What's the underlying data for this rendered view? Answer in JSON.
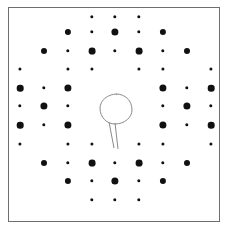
{
  "figure": {
    "kind": "electron-diffraction-pattern",
    "background_color": "#ffffff",
    "frame_border_color": "#6e6e6e",
    "spot_color": "#111111",
    "annotation_color": "#8a8a8a",
    "frame": {
      "x": 8,
      "y": 7,
      "width": 212,
      "height": 215
    }
  },
  "chart_data": {
    "type": "scatter",
    "title": "",
    "subtitle": "",
    "xlabel": "",
    "ylabel": "",
    "grid": false,
    "legend": null,
    "xlim": [
      0,
      212
    ],
    "ylim": [
      0,
      215
    ],
    "lattice": {
      "x_spacing": 23.6,
      "y_spacing": 18.4,
      "center_x": 107,
      "center_y": 108
    },
    "size_legend": {
      "large": "strong reflection",
      "small": "weak reflection"
    },
    "points": [
      {
        "x": 83,
        "y": 9,
        "r": 1.7,
        "intensity": "weak"
      },
      {
        "x": 106,
        "y": 9,
        "r": 1.7,
        "intensity": "weak"
      },
      {
        "x": 130,
        "y": 9,
        "r": 1.7,
        "intensity": "weak"
      },
      {
        "x": 59,
        "y": 24,
        "r": 3.1,
        "intensity": "strong"
      },
      {
        "x": 83,
        "y": 24,
        "r": 1.7,
        "intensity": "weak"
      },
      {
        "x": 106,
        "y": 24,
        "r": 3.6,
        "intensity": "strong"
      },
      {
        "x": 130,
        "y": 24,
        "r": 1.7,
        "intensity": "weak"
      },
      {
        "x": 154,
        "y": 24,
        "r": 3.1,
        "intensity": "strong"
      },
      {
        "x": 35,
        "y": 43,
        "r": 3.0,
        "intensity": "strong"
      },
      {
        "x": 59,
        "y": 43,
        "r": 1.7,
        "intensity": "weak"
      },
      {
        "x": 83,
        "y": 43,
        "r": 3.4,
        "intensity": "strong"
      },
      {
        "x": 106,
        "y": 43,
        "r": 1.7,
        "intensity": "weak"
      },
      {
        "x": 130,
        "y": 43,
        "r": 3.4,
        "intensity": "strong"
      },
      {
        "x": 154,
        "y": 43,
        "r": 1.7,
        "intensity": "weak"
      },
      {
        "x": 178,
        "y": 43,
        "r": 3.0,
        "intensity": "strong"
      },
      {
        "x": 11,
        "y": 61,
        "r": 1.6,
        "intensity": "weak"
      },
      {
        "x": 59,
        "y": 61,
        "r": 1.6,
        "intensity": "weak"
      },
      {
        "x": 83,
        "y": 61,
        "r": 1.6,
        "intensity": "weak"
      },
      {
        "x": 130,
        "y": 61,
        "r": 1.6,
        "intensity": "weak"
      },
      {
        "x": 154,
        "y": 61,
        "r": 1.6,
        "intensity": "weak"
      },
      {
        "x": 202,
        "y": 61,
        "r": 1.6,
        "intensity": "weak"
      },
      {
        "x": 11,
        "y": 80,
        "r": 3.3,
        "intensity": "strong"
      },
      {
        "x": 35,
        "y": 80,
        "r": 1.7,
        "intensity": "weak"
      },
      {
        "x": 59,
        "y": 80,
        "r": 3.6,
        "intensity": "strong"
      },
      {
        "x": 154,
        "y": 80,
        "r": 3.6,
        "intensity": "strong"
      },
      {
        "x": 178,
        "y": 80,
        "r": 1.7,
        "intensity": "weak"
      },
      {
        "x": 202,
        "y": 80,
        "r": 3.3,
        "intensity": "strong"
      },
      {
        "x": 11,
        "y": 98,
        "r": 1.7,
        "intensity": "weak"
      },
      {
        "x": 35,
        "y": 98,
        "r": 3.6,
        "intensity": "strong"
      },
      {
        "x": 59,
        "y": 98,
        "r": 1.7,
        "intensity": "weak"
      },
      {
        "x": 154,
        "y": 98,
        "r": 1.7,
        "intensity": "weak"
      },
      {
        "x": 178,
        "y": 98,
        "r": 3.6,
        "intensity": "strong"
      },
      {
        "x": 202,
        "y": 98,
        "r": 1.7,
        "intensity": "weak"
      },
      {
        "x": 11,
        "y": 117,
        "r": 3.3,
        "intensity": "strong"
      },
      {
        "x": 35,
        "y": 117,
        "r": 1.7,
        "intensity": "weak"
      },
      {
        "x": 59,
        "y": 117,
        "r": 3.6,
        "intensity": "strong"
      },
      {
        "x": 154,
        "y": 117,
        "r": 3.6,
        "intensity": "strong"
      },
      {
        "x": 178,
        "y": 117,
        "r": 1.7,
        "intensity": "weak"
      },
      {
        "x": 202,
        "y": 117,
        "r": 3.3,
        "intensity": "strong"
      },
      {
        "x": 11,
        "y": 136,
        "r": 1.6,
        "intensity": "weak"
      },
      {
        "x": 59,
        "y": 136,
        "r": 1.6,
        "intensity": "weak"
      },
      {
        "x": 83,
        "y": 136,
        "r": 1.6,
        "intensity": "weak"
      },
      {
        "x": 130,
        "y": 136,
        "r": 1.6,
        "intensity": "weak"
      },
      {
        "x": 154,
        "y": 136,
        "r": 1.6,
        "intensity": "weak"
      },
      {
        "x": 202,
        "y": 136,
        "r": 1.6,
        "intensity": "weak"
      },
      {
        "x": 35,
        "y": 155,
        "r": 3.0,
        "intensity": "strong"
      },
      {
        "x": 59,
        "y": 155,
        "r": 1.7,
        "intensity": "weak"
      },
      {
        "x": 83,
        "y": 155,
        "r": 3.4,
        "intensity": "strong"
      },
      {
        "x": 106,
        "y": 155,
        "r": 1.7,
        "intensity": "weak"
      },
      {
        "x": 130,
        "y": 155,
        "r": 3.4,
        "intensity": "strong"
      },
      {
        "x": 154,
        "y": 155,
        "r": 1.7,
        "intensity": "weak"
      },
      {
        "x": 178,
        "y": 155,
        "r": 3.0,
        "intensity": "strong"
      },
      {
        "x": 59,
        "y": 173,
        "r": 3.1,
        "intensity": "strong"
      },
      {
        "x": 83,
        "y": 173,
        "r": 1.7,
        "intensity": "weak"
      },
      {
        "x": 106,
        "y": 173,
        "r": 3.6,
        "intensity": "strong"
      },
      {
        "x": 130,
        "y": 173,
        "r": 1.7,
        "intensity": "weak"
      },
      {
        "x": 154,
        "y": 173,
        "r": 3.1,
        "intensity": "strong"
      },
      {
        "x": 83,
        "y": 192,
        "r": 1.7,
        "intensity": "weak"
      },
      {
        "x": 106,
        "y": 192,
        "r": 1.7,
        "intensity": "weak"
      },
      {
        "x": 130,
        "y": 192,
        "r": 1.7,
        "intensity": "weak"
      }
    ],
    "annotations": [
      {
        "kind": "circle-with-leader",
        "label": "",
        "circle": {
          "cx": 107,
          "cy": 101,
          "rx": 16,
          "ry": 15
        },
        "leader": {
          "x1": 100,
          "y1": 114,
          "x2": 105,
          "y2": 140
        },
        "stroke": "#8a8a8a",
        "stroke_width": 1
      }
    ]
  }
}
